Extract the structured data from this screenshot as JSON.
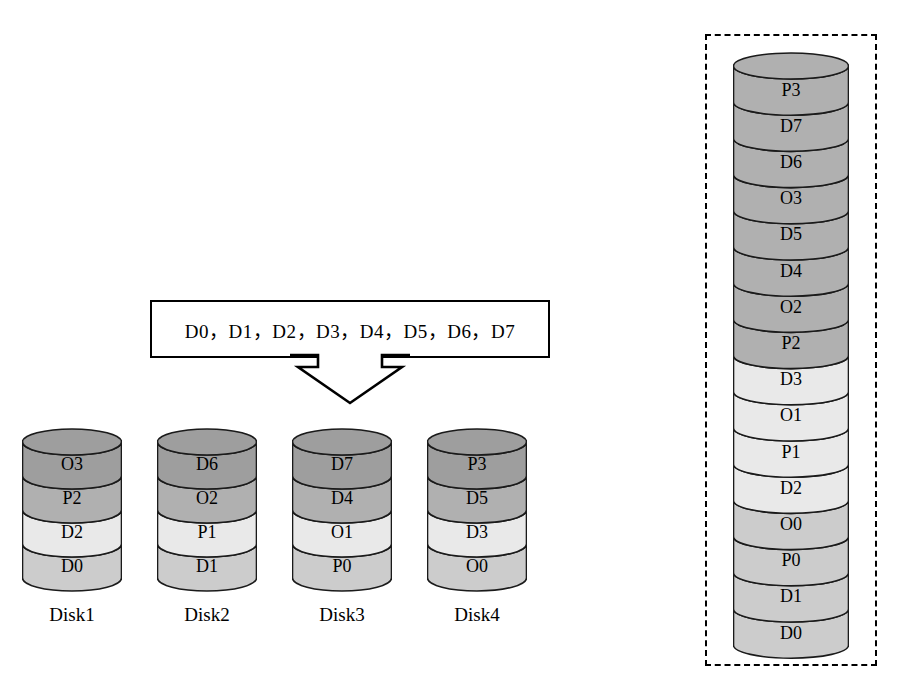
{
  "diagram": {
    "source_box": {
      "text": "D0，D1，D2，D3，D4，D5，D6，D7",
      "items": [
        "D0",
        "D1",
        "D2",
        "D3",
        "D4",
        "D5",
        "D6",
        "D7"
      ],
      "separator": "，"
    },
    "arrow": {
      "name": "down-arrow",
      "direction": "down"
    },
    "colors": {
      "shade_dark": "#9e9e9e",
      "shade_medium": "#b0b0b0",
      "shade_light": "#cccccc",
      "shade_pale": "#e9e9e9",
      "stroke": "#1a1a1a",
      "background": "#ffffff"
    },
    "disks": [
      {
        "label": "Disk1",
        "bands": [
          {
            "text": "O3",
            "shade": "shade_dark"
          },
          {
            "text": "P2",
            "shade": "shade_medium"
          },
          {
            "text": "D2",
            "shade": "shade_pale"
          },
          {
            "text": "D0",
            "shade": "shade_light"
          }
        ]
      },
      {
        "label": "Disk2",
        "bands": [
          {
            "text": "D6",
            "shade": "shade_dark"
          },
          {
            "text": "O2",
            "shade": "shade_medium"
          },
          {
            "text": "P1",
            "shade": "shade_pale"
          },
          {
            "text": "D1",
            "shade": "shade_light"
          }
        ]
      },
      {
        "label": "Disk3",
        "bands": [
          {
            "text": "D7",
            "shade": "shade_dark"
          },
          {
            "text": "D4",
            "shade": "shade_medium"
          },
          {
            "text": "O1",
            "shade": "shade_pale"
          },
          {
            "text": "P0",
            "shade": "shade_light"
          }
        ]
      },
      {
        "label": "Disk4",
        "bands": [
          {
            "text": "P3",
            "shade": "shade_dark"
          },
          {
            "text": "D5",
            "shade": "shade_medium"
          },
          {
            "text": "D3",
            "shade": "shade_pale"
          },
          {
            "text": "O0",
            "shade": "shade_light"
          }
        ]
      }
    ],
    "stack": {
      "label": "",
      "bands": [
        {
          "text": "P3",
          "shade": "shade_medium"
        },
        {
          "text": "D7",
          "shade": "shade_medium"
        },
        {
          "text": "D6",
          "shade": "shade_medium"
        },
        {
          "text": "O3",
          "shade": "shade_medium"
        },
        {
          "text": "D5",
          "shade": "shade_medium"
        },
        {
          "text": "D4",
          "shade": "shade_medium"
        },
        {
          "text": "O2",
          "shade": "shade_medium"
        },
        {
          "text": "P2",
          "shade": "shade_medium"
        },
        {
          "text": "D3",
          "shade": "shade_pale"
        },
        {
          "text": "O1",
          "shade": "shade_pale"
        },
        {
          "text": "P1",
          "shade": "shade_pale"
        },
        {
          "text": "D2",
          "shade": "shade_pale"
        },
        {
          "text": "O0",
          "shade": "shade_light"
        },
        {
          "text": "P0",
          "shade": "shade_light"
        },
        {
          "text": "D1",
          "shade": "shade_light"
        },
        {
          "text": "D0",
          "shade": "shade_light"
        }
      ]
    }
  }
}
